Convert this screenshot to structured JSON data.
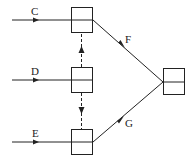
{
  "diagram": {
    "colors": {
      "stroke": "#222222",
      "background": "#ffffff"
    },
    "inputs": [
      {
        "label": "C"
      },
      {
        "label": "D"
      },
      {
        "label": "E"
      }
    ],
    "edges": [
      {
        "label": "F"
      },
      {
        "label": "G"
      }
    ]
  }
}
